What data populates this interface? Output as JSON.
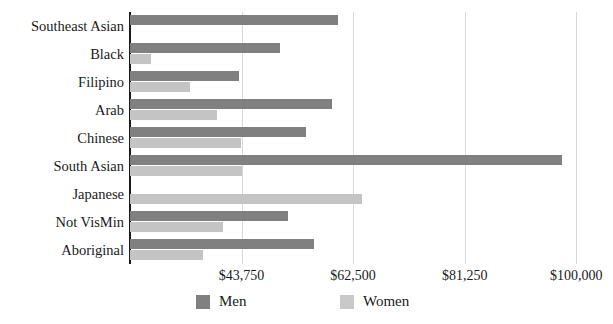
{
  "chart_data": {
    "type": "bar",
    "orientation": "horizontal",
    "title": "",
    "xlabel": "",
    "ylabel": "",
    "categories": [
      "Southeast Asian",
      "Black",
      "Filipino",
      "Arab",
      "Chinese",
      "South Asian",
      "Japanese",
      "Not VisMin",
      "Aboriginal"
    ],
    "series": [
      {
        "name": "Men",
        "color": "#808080",
        "values": [
          59900,
          50200,
          43400,
          58900,
          54500,
          97600,
          0,
          51600,
          55900
        ]
      },
      {
        "name": "Women",
        "color": "#c4c4c4",
        "values": [
          0,
          28500,
          35100,
          39700,
          43600,
          43900,
          64000,
          40600,
          37300
        ]
      }
    ],
    "xticks": [
      {
        "label": "$43,750",
        "value": 43750
      },
      {
        "label": "$62,500",
        "value": 62500
      },
      {
        "label": "$81,250",
        "value": 81250
      },
      {
        "label": "$100,000",
        "value": 100000
      }
    ],
    "xlim": [
      25000,
      104000
    ],
    "grid": true,
    "legend_position": "bottom",
    "legend": [
      {
        "label": "Men",
        "color": "#808080"
      },
      {
        "label": "Women",
        "color": "#c9c9c9"
      }
    ]
  }
}
